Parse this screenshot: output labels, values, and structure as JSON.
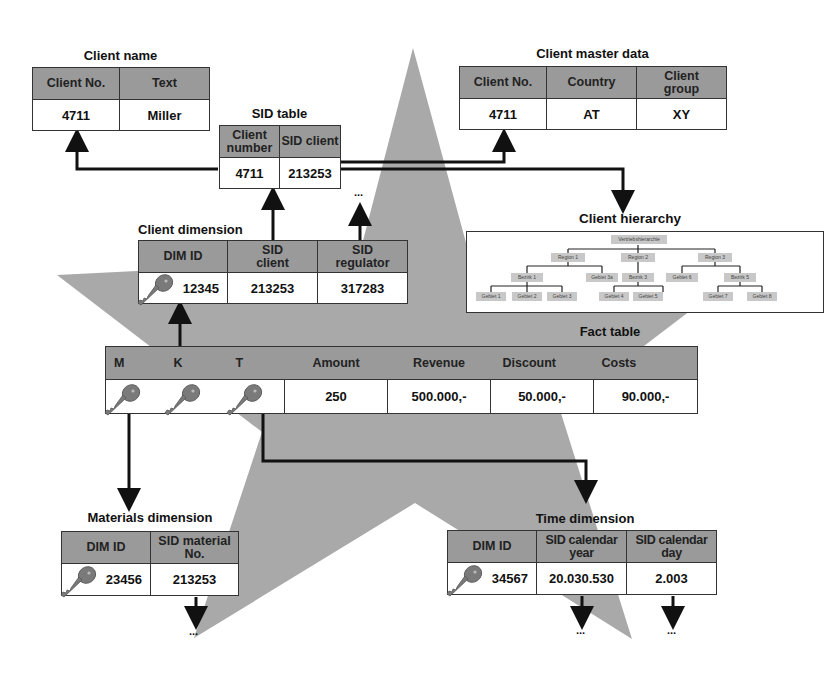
{
  "client_name": {
    "title": "Client name",
    "headers": [
      "Client No.",
      "Text"
    ],
    "row": [
      "4711",
      "Miller"
    ]
  },
  "sid_table": {
    "title": "SID table",
    "headers": [
      "Client number",
      "SID client"
    ],
    "row": [
      "4711",
      "213253"
    ]
  },
  "client_master": {
    "title": "Client master data",
    "headers": [
      "Client No.",
      "Country",
      "Client group"
    ],
    "row": [
      "4711",
      "AT",
      "XY"
    ]
  },
  "client_hierarchy": {
    "title": "Client hierarchy",
    "root": "Vertriebshierarchie",
    "regions": [
      "Region 1",
      "Region 2",
      "Region 3"
    ],
    "level2": [
      "Bezirk 1",
      "Gebiet 3a",
      "Bezirk 3",
      "Gebiet 6",
      "Bezirk 5"
    ],
    "leaves": [
      "Gebiet 1",
      "Gebiet 2",
      "Gebiet 3",
      "Gebiet 4",
      "Gebiet 5",
      "Gebiet 7",
      "Gebiet 8"
    ]
  },
  "client_dimension": {
    "title": "Client dimension",
    "headers": [
      "DIM ID",
      "SID client",
      "SID regulator"
    ],
    "row": [
      "12345",
      "213253",
      "317283"
    ],
    "continuation": "..."
  },
  "fact_table": {
    "title": "Fact table",
    "key_headers": [
      "M",
      "K",
      "T"
    ],
    "headers": [
      "Amount",
      "Revenue",
      "Discount",
      "Costs"
    ],
    "row": [
      "250",
      "500.000,-",
      "50.000,-",
      "90.000,-"
    ]
  },
  "materials_dimension": {
    "title": "Materials dimension",
    "headers": [
      "DIM ID",
      "SID material No."
    ],
    "row": [
      "23456",
      "213253"
    ],
    "continuation": "..."
  },
  "time_dimension": {
    "title": "Time dimension",
    "headers": [
      "DIM ID",
      "SID calendar year",
      "SID calendar day"
    ],
    "row": [
      "34567",
      "20.030.530",
      "2.003"
    ],
    "continuation_year": "...",
    "continuation_day": "..."
  },
  "colors": {
    "star_fill": "#a9a9a9",
    "header_fill": "#9a9a9a",
    "key_fill": "#7a7a7a",
    "line": "#111111"
  }
}
